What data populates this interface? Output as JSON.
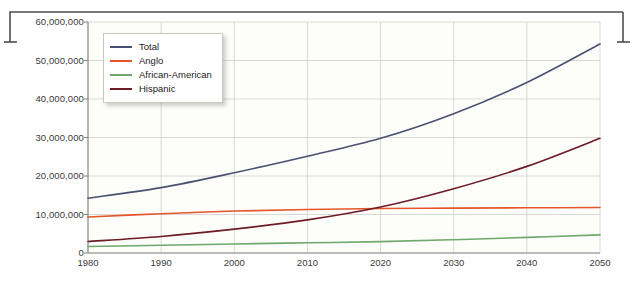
{
  "chart_data": {
    "type": "line",
    "title": "",
    "xlabel": "",
    "ylabel": "",
    "x": [
      1980,
      1990,
      2000,
      2010,
      2020,
      2030,
      2040,
      2050
    ],
    "xlim": [
      1980,
      2050
    ],
    "ylim": [
      0,
      60000000
    ],
    "grid": true,
    "legend_position": "top-left",
    "series": [
      {
        "name": "Total",
        "color": "#4a5170",
        "values": [
          14230000,
          16990000,
          20850000,
          25150000,
          29800000,
          36200000,
          44300000,
          54300000
        ]
      },
      {
        "name": "Anglo",
        "color": "#e5562a",
        "values": [
          9350000,
          10200000,
          10900000,
          11300000,
          11550000,
          11650000,
          11750000,
          11800000
        ]
      },
      {
        "name": "African-American",
        "color": "#6fa86a",
        "values": [
          1700000,
          2000000,
          2350000,
          2650000,
          2950000,
          3450000,
          4050000,
          4700000
        ]
      },
      {
        "name": "Hispanic",
        "color": "#6d1b24",
        "values": [
          3000000,
          4300000,
          6200000,
          8600000,
          11950000,
          16700000,
          22500000,
          29800000
        ]
      }
    ]
  },
  "axes": {
    "y_ticks": [
      {
        "value": 0,
        "label": "0"
      },
      {
        "value": 10000000,
        "label": "10,000,000"
      },
      {
        "value": 20000000,
        "label": "20,000,000"
      },
      {
        "value": 30000000,
        "label": "30,000,000"
      },
      {
        "value": 40000000,
        "label": "40,000,000"
      },
      {
        "value": 50000000,
        "label": "50,000,000"
      },
      {
        "value": 60000000,
        "label": "60,000,000"
      }
    ],
    "x_ticks": [
      {
        "value": 1980,
        "label": "1980"
      },
      {
        "value": 1990,
        "label": "1990"
      },
      {
        "value": 2000,
        "label": "2000"
      },
      {
        "value": 2010,
        "label": "2010"
      },
      {
        "value": 2020,
        "label": "2020"
      },
      {
        "value": 2030,
        "label": "2030"
      },
      {
        "value": 2040,
        "label": "2040"
      },
      {
        "value": 2050,
        "label": "2050"
      }
    ]
  },
  "legend": {
    "entries": [
      {
        "label": "Total",
        "color": "#4a5170"
      },
      {
        "label": "Anglo",
        "color": "#e5562a"
      },
      {
        "label": "African-American",
        "color": "#6fa86a"
      },
      {
        "label": "Hispanic",
        "color": "#6d1b24"
      }
    ]
  },
  "style": {
    "plot_background": "#fdfdfa",
    "grid_color": "#d0d0cb",
    "axis_color": "#8a8a84",
    "text_color": "#3b3b3b",
    "frame_color": "#4f4f4f"
  }
}
